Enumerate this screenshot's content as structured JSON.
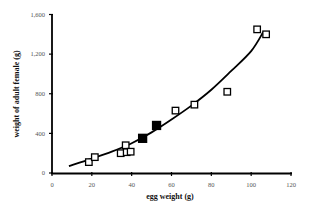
{
  "chart_data": {
    "type": "scatter",
    "title": "",
    "xlabel": "egg weight (g)",
    "ylabel": "weight of adult female (g)",
    "xlim": [
      0,
      120
    ],
    "ylim": [
      0,
      1600
    ],
    "x_ticks": [
      0,
      20,
      40,
      60,
      80,
      100,
      120
    ],
    "x_tick_labels": [
      "0",
      "20",
      "40",
      "60",
      "80",
      "100",
      "120"
    ],
    "y_ticks": [
      0,
      400,
      800,
      1200,
      1600
    ],
    "y_tick_labels": [
      "0",
      "400",
      "800",
      "1,200",
      "1,600"
    ],
    "grid": false,
    "legend": null,
    "series": [
      {
        "name": "open squares",
        "marker": "square-open",
        "points": [
          {
            "x": 18.5,
            "y": 110
          },
          {
            "x": 21.5,
            "y": 160
          },
          {
            "x": 34.5,
            "y": 200
          },
          {
            "x": 37,
            "y": 280
          },
          {
            "x": 37.5,
            "y": 210
          },
          {
            "x": 39.5,
            "y": 215
          },
          {
            "x": 62,
            "y": 630
          },
          {
            "x": 71.5,
            "y": 690
          },
          {
            "x": 88,
            "y": 820
          },
          {
            "x": 103,
            "y": 1450
          },
          {
            "x": 107.5,
            "y": 1400
          }
        ]
      },
      {
        "name": "filled squares",
        "marker": "square-filled",
        "points": [
          {
            "x": 45.5,
            "y": 350
          },
          {
            "x": 52.5,
            "y": 480
          }
        ]
      },
      {
        "name": "trend line",
        "type": "line",
        "description": "power/polynomial fit",
        "points": [
          {
            "x": 8.5,
            "y": 70
          },
          {
            "x": 20,
            "y": 145
          },
          {
            "x": 30,
            "y": 215
          },
          {
            "x": 40,
            "y": 300
          },
          {
            "x": 50,
            "y": 410
          },
          {
            "x": 60,
            "y": 540
          },
          {
            "x": 70,
            "y": 680
          },
          {
            "x": 80,
            "y": 840
          },
          {
            "x": 90,
            "y": 1030
          },
          {
            "x": 100,
            "y": 1230
          },
          {
            "x": 106,
            "y": 1420
          }
        ]
      }
    ]
  }
}
